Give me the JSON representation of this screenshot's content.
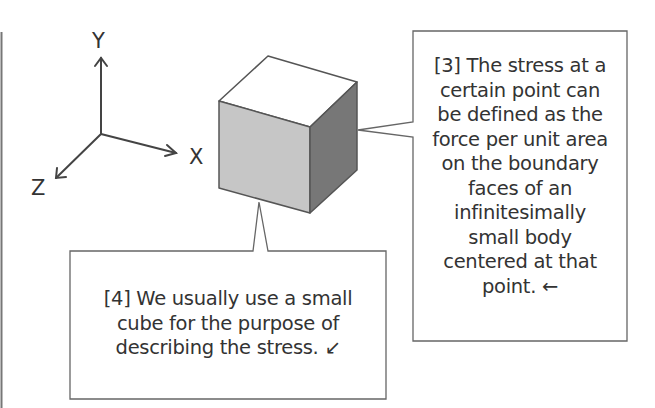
{
  "axes": {
    "x_label": "X",
    "y_label": "Y",
    "z_label": "Z"
  },
  "cube": {
    "top_color": "#ffffff",
    "front_color": "#c6c6c6",
    "side_color": "#777777",
    "edge_color": "#555555"
  },
  "callout_3": {
    "lines": [
      "[3] The stress at a",
      "certain point can",
      "be defined as the",
      "force per unit area",
      "on the boundary",
      "faces of an",
      "infinitesimally",
      "small body",
      "centered at that",
      "point. ←"
    ]
  },
  "callout_4": {
    "lines": [
      "[4] We usually use a small",
      "cube for the purpose of",
      "describing the stress. ↙"
    ]
  }
}
